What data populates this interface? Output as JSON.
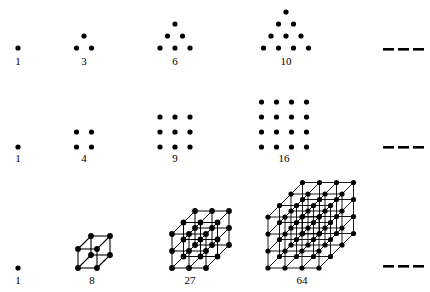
{
  "figure": {
    "background_color": "#ffffff",
    "ink_color": "#000000"
  },
  "chart_data": {
    "type": "scatter",
    "xlabel": "",
    "ylabel": "",
    "grid": false,
    "legend": null,
    "rows": [
      {
        "name": "triangular-numbers",
        "sequence_label": "triangular",
        "categories": [
          "1",
          "2",
          "3",
          "4"
        ],
        "values": [
          1,
          3,
          6,
          10
        ],
        "labels": [
          "1",
          "3",
          "6",
          "10"
        ],
        "trailing": "– – –"
      },
      {
        "name": "square-numbers",
        "sequence_label": "square",
        "categories": [
          "1",
          "2",
          "3",
          "4"
        ],
        "values": [
          1,
          4,
          9,
          16
        ],
        "labels": [
          "1",
          "4",
          "9",
          "16"
        ],
        "trailing": "– – –"
      },
      {
        "name": "cubic-numbers",
        "sequence_label": "cubic",
        "categories": [
          "1",
          "2",
          "3",
          "4"
        ],
        "values": [
          1,
          8,
          27,
          64
        ],
        "labels": [
          "1",
          "8",
          "27",
          "64"
        ],
        "trailing": "– – –"
      }
    ]
  },
  "labels": {
    "row1": {
      "n1": "1",
      "n2": "3",
      "n3": "6",
      "n4": "10"
    },
    "row2": {
      "n1": "1",
      "n2": "4",
      "n3": "9",
      "n4": "16"
    },
    "row3": {
      "n1": "1",
      "n2": "8",
      "n3": "27",
      "n4": "64"
    }
  }
}
